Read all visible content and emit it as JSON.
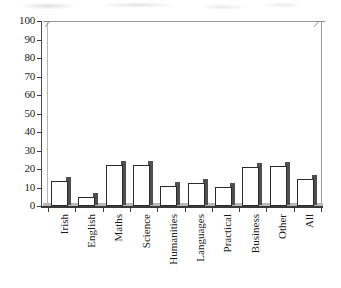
{
  "chart_data": {
    "type": "bar",
    "title": "",
    "subtitle": "",
    "xlabel": "",
    "ylabel": "",
    "ylim": [
      0,
      100
    ],
    "yticks": [
      0,
      10,
      20,
      30,
      40,
      50,
      60,
      70,
      80,
      90,
      100
    ],
    "grid": false,
    "legend": false,
    "legend_position": "none",
    "categories": [
      "Irish",
      "English",
      "Maths",
      "Science",
      "Humanities",
      "Languages",
      "Practical",
      "Business",
      "Other",
      "All"
    ],
    "values": [
      13.5,
      5,
      22,
      22,
      11,
      12.5,
      10.5,
      21,
      21.5,
      14.5
    ],
    "series": [
      {
        "name": "",
        "values": [
          13.5,
          5,
          22,
          22,
          11,
          12.5,
          10.5,
          21,
          21.5,
          14.5
        ]
      }
    ]
  },
  "style": {
    "bar_fill": "#ffffff",
    "bar_outline": "#2b2b2b",
    "bar_shadow": "#4f4f4f",
    "axis_color": "#3e3e3e",
    "frame_color": "#9a9a9a",
    "background": "#ffffff",
    "text_color": "#1a1a1a"
  }
}
